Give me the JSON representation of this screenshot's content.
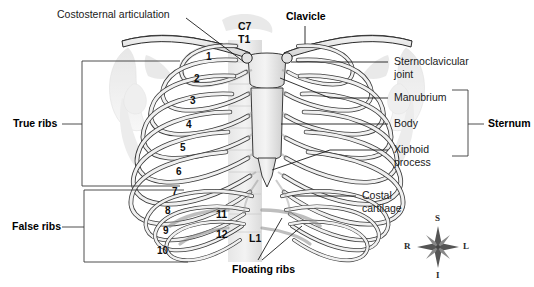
{
  "figure": {
    "background_color": "#ffffff",
    "line_color": "#1b1b1b",
    "bone_fill": "#e9e9e9",
    "bone_shadow": "#bdbdbd",
    "ghost_fill": "#dcdcdc"
  },
  "labels": {
    "costosternal_articulation": "Costosternal articulation",
    "clavicle": "Clavicle",
    "c7": "C7",
    "t1": "T1",
    "sternoclavicular_joint_line1": "Sternoclavicular",
    "sternoclavicular_joint_line2": "joint",
    "manubrium": "Manubrium",
    "body": "Body",
    "xiphoid_line1": "Xiphoid",
    "xiphoid_line2": "process",
    "sternum": "Sternum",
    "costal_line1": "Costal",
    "costal_line2": "cartilage",
    "true_ribs": "True ribs",
    "false_ribs": "False ribs",
    "floating_ribs": "Floating ribs",
    "l1": "L1"
  },
  "rib_numbers": [
    {
      "n": "1",
      "x": 206,
      "y": 51
    },
    {
      "n": "2",
      "x": 194,
      "y": 73
    },
    {
      "n": "3",
      "x": 190,
      "y": 95
    },
    {
      "n": "4",
      "x": 186,
      "y": 119
    },
    {
      "n": "5",
      "x": 180,
      "y": 142
    },
    {
      "n": "6",
      "x": 176,
      "y": 166
    },
    {
      "n": "7",
      "x": 172,
      "y": 186
    },
    {
      "n": "8",
      "x": 165,
      "y": 205
    },
    {
      "n": "9",
      "x": 163,
      "y": 225
    },
    {
      "n": "10",
      "x": 157,
      "y": 245
    }
  ],
  "vertebra_numbers": [
    {
      "n": "11",
      "x": 216,
      "y": 208
    },
    {
      "n": "12",
      "x": 216,
      "y": 228
    }
  ],
  "compass": {
    "superior": "S",
    "inferior": "I",
    "right": "R",
    "left": "L",
    "center_x": 438,
    "center_y": 247
  }
}
